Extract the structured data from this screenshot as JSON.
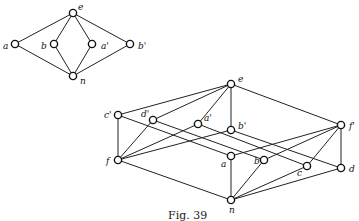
{
  "caption": "Fig. 39",
  "small_diagram": {
    "nodes": [
      {
        "id": "e",
        "label": "e",
        "x": 73,
        "y": 13,
        "lx": 78,
        "ly": 10
      },
      {
        "id": "a",
        "label": "a",
        "x": 15,
        "y": 44,
        "lx": 3,
        "ly": 49
      },
      {
        "id": "b",
        "label": "b",
        "x": 54,
        "y": 44,
        "lx": 41,
        "ly": 49
      },
      {
        "id": "a'",
        "label": "a'",
        "x": 92,
        "y": 44,
        "lx": 101,
        "ly": 49
      },
      {
        "id": "b'",
        "label": "b'",
        "x": 130,
        "y": 44,
        "lx": 138,
        "ly": 49
      },
      {
        "id": "n",
        "label": "n",
        "x": 73,
        "y": 76,
        "lx": 80,
        "ly": 84
      }
    ],
    "edges": [
      [
        "e",
        "a"
      ],
      [
        "e",
        "b"
      ],
      [
        "e",
        "a'"
      ],
      [
        "e",
        "b'"
      ],
      [
        "a",
        "n"
      ],
      [
        "b",
        "n"
      ],
      [
        "a'",
        "n"
      ],
      [
        "b'",
        "n"
      ]
    ]
  },
  "large_diagram": {
    "nodes": [
      {
        "id": "e",
        "label": "e",
        "x": 231,
        "y": 84,
        "lx": 238,
        "ly": 82
      },
      {
        "id": "c'",
        "label": "c'",
        "x": 118,
        "y": 115,
        "lx": 104,
        "ly": 118
      },
      {
        "id": "d'",
        "label": "d'",
        "x": 153,
        "y": 120,
        "lx": 141,
        "ly": 117
      },
      {
        "id": "a'",
        "label": "a'",
        "x": 198,
        "y": 124,
        "lx": 204,
        "ly": 121
      },
      {
        "id": "b'",
        "label": "b'",
        "x": 231,
        "y": 130,
        "lx": 238,
        "ly": 129
      },
      {
        "id": "f'",
        "label": "f'",
        "x": 341,
        "y": 125,
        "lx": 349,
        "ly": 129
      },
      {
        "id": "f",
        "label": "f",
        "x": 118,
        "y": 160,
        "lx": 106,
        "ly": 164
      },
      {
        "id": "a",
        "label": "a",
        "x": 231,
        "y": 156,
        "lx": 221,
        "ly": 167
      },
      {
        "id": "b",
        "label": "b",
        "x": 264,
        "y": 160,
        "lx": 254,
        "ly": 164
      },
      {
        "id": "c",
        "label": "c",
        "x": 307,
        "y": 166,
        "lx": 297,
        "ly": 176
      },
      {
        "id": "d",
        "label": "d",
        "x": 341,
        "y": 168,
        "lx": 349,
        "ly": 172
      },
      {
        "id": "n",
        "label": "n",
        "x": 231,
        "y": 200,
        "lx": 229,
        "ly": 213
      }
    ],
    "edges": [
      [
        "e",
        "c'"
      ],
      [
        "e",
        "d'"
      ],
      [
        "e",
        "a'"
      ],
      [
        "e",
        "b'"
      ],
      [
        "e",
        "f'"
      ],
      [
        "c'",
        "f"
      ],
      [
        "c'",
        "a"
      ],
      [
        "d'",
        "f"
      ],
      [
        "d'",
        "b"
      ],
      [
        "a'",
        "f"
      ],
      [
        "a'",
        "c"
      ],
      [
        "b'",
        "f"
      ],
      [
        "b'",
        "d"
      ],
      [
        "f'",
        "a"
      ],
      [
        "f'",
        "b"
      ],
      [
        "f'",
        "c"
      ],
      [
        "f'",
        "d"
      ],
      [
        "f",
        "n"
      ],
      [
        "a",
        "n"
      ],
      [
        "b",
        "n"
      ],
      [
        "c",
        "n"
      ],
      [
        "d",
        "n"
      ]
    ]
  }
}
